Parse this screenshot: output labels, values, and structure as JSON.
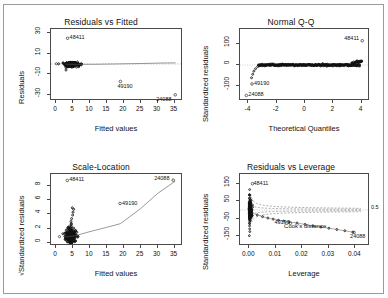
{
  "figure": {
    "background": "#ffffff",
    "frame_color": "#9a9a9a",
    "axis_color": "#4a4a4a",
    "point_color": "#111111"
  },
  "chart_data": [
    {
      "type": "scatter",
      "title": "Residuals vs Fitted",
      "xlabel": "Fitted values",
      "ylabel": "Residuals",
      "xlim": [
        -1.5,
        37.5
      ],
      "ylim": [
        -36,
        34
      ],
      "xticks": [
        0,
        5,
        10,
        15,
        20,
        25,
        30,
        35
      ],
      "xticklabels": [
        "0",
        "5",
        "10",
        "15",
        "20",
        "25",
        "30",
        "35"
      ],
      "yticks": [
        -30,
        -10,
        10,
        30
      ],
      "yticklabels": [
        "-30",
        "-10",
        "10",
        "30"
      ],
      "grid": false,
      "legend": "none",
      "smoother": true,
      "reference_line": "horizontal-zero",
      "annotations": [
        {
          "label": "48411",
          "x": 3.4,
          "y": 25.0
        },
        {
          "label": "49190",
          "x": 19.0,
          "y": -17.0
        },
        {
          "label": "24088",
          "x": 35.2,
          "y": -30.0
        }
      ],
      "cluster": {
        "x_center": 4.3,
        "y_center": -0.5,
        "x_spread": 1.6,
        "y_spread": 2.6,
        "n": 220
      }
    },
    {
      "type": "scatter",
      "title": "Normal Q-Q",
      "xlabel": "Theoretical Quantiles",
      "ylabel": "Standardized residuals",
      "xlim": [
        -4.6,
        4.6
      ],
      "ylim": [
        -175,
        175
      ],
      "xticks": [
        -4,
        -2,
        0,
        2,
        4
      ],
      "xticklabels": [
        "-4",
        "-2",
        "0",
        "2",
        "4"
      ],
      "yticks": [
        -100,
        0,
        100
      ],
      "yticklabels": [
        "-100",
        "0",
        "100"
      ],
      "grid": false,
      "legend": "none",
      "reference_line": "qq-dotted",
      "annotations": [
        {
          "label": "48411",
          "x": 4.05,
          "y": 118.0
        },
        {
          "label": "49190",
          "x": -3.75,
          "y": -92.0
        },
        {
          "label": "24088",
          "x": -4.15,
          "y": -148.0
        }
      ]
    },
    {
      "type": "scatter",
      "title": "Scale-Location",
      "xlabel": "Fitted values",
      "ylabel": "√Standardized residuals",
      "xlim": [
        -1.5,
        37.5
      ],
      "ylim": [
        -0.4,
        9.6
      ],
      "xticks": [
        0,
        5,
        10,
        15,
        20,
        25,
        30,
        35
      ],
      "xticklabels": [
        "0",
        "5",
        "10",
        "15",
        "20",
        "25",
        "30",
        "35"
      ],
      "yticks": [
        0,
        2,
        4,
        6,
        8
      ],
      "yticklabels": [
        "0",
        "2",
        "4",
        "6",
        "8"
      ],
      "grid": false,
      "legend": "none",
      "smoother": true,
      "annotations": [
        {
          "label": "48411",
          "x": 3.3,
          "y": 8.7
        },
        {
          "label": "49190",
          "x": 18.9,
          "y": 5.5
        },
        {
          "label": "24088",
          "x": 34.6,
          "y": 8.75
        }
      ],
      "cluster": {
        "x_center": 4.3,
        "y_center": 1.0,
        "x_spread": 1.5,
        "y_spread": 0.85,
        "n": 220
      }
    },
    {
      "type": "scatter",
      "title": "Residuals vs Leverage",
      "xlabel": "Leverage",
      "ylabel": "Standardized residuals",
      "xlim": [
        -0.0035,
        0.0455
      ],
      "ylim": [
        -205,
        205
      ],
      "xticks": [
        0.0,
        0.01,
        0.02,
        0.03,
        0.04
      ],
      "xticklabels": [
        "0.00",
        "0.01",
        "0.02",
        "0.03",
        "0.04"
      ],
      "yticks": [
        -150,
        -50,
        50,
        150
      ],
      "yticklabels": [
        "-150",
        "-50",
        "50",
        "150"
      ],
      "grid": false,
      "legend": "Cook's distance",
      "cooks_label": "Cook's distance",
      "cooks_levels": [
        "0.5"
      ],
      "annotations": [
        {
          "label": "48411",
          "x": 0.0012,
          "y": 150.0
        },
        {
          "label": "49190",
          "x": 0.0155,
          "y": -76.0
        },
        {
          "label": "24088",
          "x": 0.0395,
          "y": -128.0
        }
      ]
    }
  ]
}
